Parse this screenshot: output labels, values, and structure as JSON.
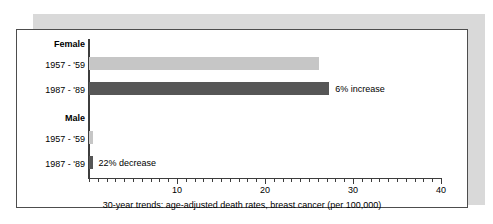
{
  "figure": {
    "frame_border_color": "#4d4d4d",
    "shadow_color": "#d9d9d9",
    "background_color": "#ffffff"
  },
  "chart_data": {
    "type": "bar",
    "orientation": "horizontal",
    "title": "",
    "subtitle": "",
    "xlabel": "30-year trends: age-adjusted death rates, breast cancer (per 100,000)",
    "ylabel": "",
    "xlim": [
      0,
      40
    ],
    "xticks": [
      10,
      20,
      30,
      40
    ],
    "xtick_labels": [
      "10",
      "20",
      "30",
      "40"
    ],
    "minor_tick_interval": 1,
    "grid": false,
    "legend": "none",
    "groups": [
      {
        "name": "Female",
        "bars": [
          {
            "category": "1957 - '59",
            "value": 26.1,
            "color": "#c6c6c6",
            "series": "1957 - '59",
            "annotation": ""
          },
          {
            "category": "1987 - '89",
            "value": 27.3,
            "color": "#565656",
            "series": "1987 - '89",
            "annotation": "6% increase"
          }
        ]
      },
      {
        "name": "Male",
        "bars": [
          {
            "category": "1957 - '59",
            "value": 0.5,
            "color": "#c6c6c6",
            "series": "1957 - '59",
            "annotation": ""
          },
          {
            "category": "1987 - '89",
            "value": 0.4,
            "color": "#565656",
            "series": "1987 - '89",
            "annotation": "22% decrease"
          }
        ]
      }
    ],
    "categories": [
      "Female 1957 - '59",
      "Female 1987 - '89",
      "Male 1957 - '59",
      "Male 1987 - '89"
    ],
    "values": [
      26.1,
      27.3,
      0.5,
      0.4
    ],
    "annotations": [
      "",
      "6% increase",
      "",
      "22% decrease"
    ]
  },
  "labels": {
    "group_female": "Female",
    "group_male": "Male",
    "female_period_1": "1957 - '59",
    "female_period_2": "1987 - '89",
    "male_period_1": "1957 - '59",
    "male_period_2": "1987 - '89",
    "note_female": "6% increase",
    "note_male": "22% decrease",
    "tick_10": "10",
    "tick_20": "20",
    "tick_30": "30",
    "tick_40": "40",
    "caption": "30-year trends: age-adjusted death rates, breast cancer (per 100,000)"
  }
}
